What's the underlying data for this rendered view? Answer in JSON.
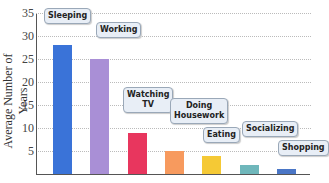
{
  "chart_data": {
    "type": "bar",
    "title": "",
    "xlabel": "",
    "ylabel": "Average Number of Years",
    "ylim": [
      0,
      35
    ],
    "yticks": [
      5,
      10,
      15,
      20,
      25,
      30,
      35
    ],
    "grid": true,
    "categories": [
      "Sleeping",
      "Working",
      "Watching TV",
      "Doing Housework",
      "Eating",
      "Socializing",
      "Shopping"
    ],
    "values": [
      28,
      25,
      9,
      5,
      4,
      2,
      1
    ],
    "colors": [
      "#3a73d8",
      "#a98fd6",
      "#e8365e",
      "#f79a5e",
      "#f5c935",
      "#6fb7bb",
      "#4a76c6"
    ]
  }
}
